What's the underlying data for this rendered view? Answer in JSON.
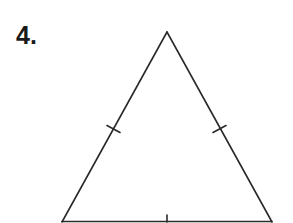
{
  "problem": {
    "number_label": "4.",
    "shape": "isosceles-triangle",
    "stroke_color": "#2a2a2a",
    "vertices": {
      "apex": [
        167,
        32
      ],
      "base_left": [
        62,
        222
      ],
      "base_right": [
        272,
        222
      ]
    },
    "tick_marks": [
      {
        "side": "left",
        "count": 1
      },
      {
        "side": "right",
        "count": 1
      },
      {
        "side": "base",
        "count": 1
      }
    ]
  }
}
